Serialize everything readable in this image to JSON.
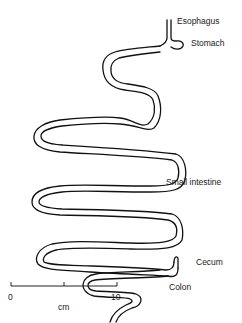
{
  "diagram": {
    "stroke_color": "#111111",
    "background": "#ffffff",
    "labels": {
      "esophagus": "Esophagus",
      "stomach": "Stomach",
      "small_intestine": "Small intestine",
      "cecum": "Cecum",
      "colon": "Colon"
    },
    "scale_bar": {
      "start": "0",
      "end": "10",
      "unit": "cm"
    }
  }
}
